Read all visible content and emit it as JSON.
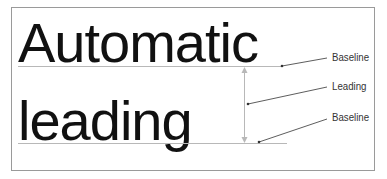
{
  "diagram": {
    "line1_text": "Automatic",
    "line2_text": "leading",
    "labels": {
      "baseline_top": "Baseline",
      "leading": "Leading",
      "baseline_bottom": "Baseline"
    },
    "colors": {
      "text": "#111111",
      "rule": "#b0b0b0",
      "leader": "#333333",
      "frame": "#9a9a9a"
    }
  }
}
